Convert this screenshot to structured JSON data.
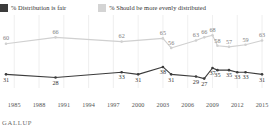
{
  "legend": {
    "items": [
      {
        "label": "% Distribution is fair",
        "color": "#3c3c3c",
        "icon": "legend-swatch-dark"
      },
      {
        "label": "% Should be more evenly distributed",
        "color": "#d4d4d4",
        "icon": "legend-swatch-light"
      }
    ]
  },
  "footer": {
    "source": "GALLUP"
  },
  "chart_data": {
    "type": "line",
    "title": "",
    "subtitle": "",
    "xlabel": "",
    "ylabel": "",
    "ylim": [
      20,
      72
    ],
    "grid": "vertical",
    "legend_position": "top-left",
    "x": [
      1984,
      1985,
      1990,
      1998,
      2000,
      2003,
      2004,
      2007,
      2008,
      2009,
      2010,
      2011,
      2013,
      2015
    ],
    "categories": [
      "1985",
      "1988",
      "1991",
      "1994",
      "1997",
      "2000",
      "2003",
      "2006",
      "2009",
      "2012",
      "2015"
    ],
    "axis_ticks": [
      "1985",
      "1988",
      "1991",
      "1994",
      "1997",
      "2000",
      "2003",
      "2006",
      "2009",
      "2012",
      "2015"
    ],
    "series": [
      {
        "name": "% Should be more evenly distributed",
        "color": "#d0d0d0",
        "label_color": "#808080",
        "x": [
          1984,
          1990,
          1998,
          2003,
          2004,
          2007,
          2008,
          2009,
          2009.6,
          2011,
          2013,
          2015
        ],
        "values": [
          60,
          66,
          62,
          65,
          56,
          63,
          66,
          68,
          58,
          57,
          59,
          63
        ]
      },
      {
        "name": "% Distribution is fair",
        "color": "#3c3c3c",
        "label_color": "#333333",
        "x": [
          1984,
          1990,
          1998,
          2000,
          2003,
          2004,
          2007,
          2008,
          2009,
          2009.6,
          2011,
          2012,
          2013,
          2015
        ],
        "values": [
          31,
          28,
          33,
          31,
          38,
          31,
          29,
          27,
          37,
          35,
          35,
          33,
          33,
          31
        ]
      }
    ],
    "point_labels": {
      "light": [
        60,
        66,
        62,
        65,
        56,
        63,
        66,
        68,
        58,
        59,
        57,
        59,
        63
      ],
      "dark": [
        31,
        28,
        33,
        31,
        38,
        31,
        29,
        27,
        37,
        35,
        35,
        33,
        31
      ]
    }
  }
}
